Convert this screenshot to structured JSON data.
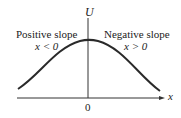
{
  "diagram": {
    "y_axis_label": "U",
    "x_axis_label": "x",
    "origin_label": "0",
    "left_region": {
      "title": "Positive slope",
      "condition_var": "x",
      "condition": "x < 0"
    },
    "right_region": {
      "title": "Negative slope",
      "condition_var": "x",
      "condition": "x > 0"
    },
    "curve": {
      "shape": "bell-shaped curve with maximum at x = 0",
      "color": "#2a2a2a"
    },
    "axis_color": "#333333"
  }
}
